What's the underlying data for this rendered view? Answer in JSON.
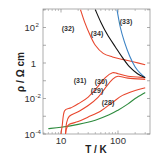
{
  "chart_data": {
    "type": "line",
    "title": "",
    "xlabel": "T / K",
    "ylabel": "ρ / Ω cm",
    "xscale": "log",
    "yscale": "log",
    "xlim": [
      4.8,
      365
    ],
    "ylim": [
      0.0001,
      1000
    ],
    "grid": false,
    "legend": "inline labels",
    "x_ticks": [
      {
        "value": 10,
        "label": "10"
      },
      {
        "value": 100,
        "label": "100"
      }
    ],
    "y_ticks": [
      {
        "value": 0.0001,
        "base": "10",
        "exp": "-4"
      },
      {
        "value": 0.01,
        "base": "10",
        "exp": "-2"
      },
      {
        "value": 1,
        "base": "1",
        "exp": ""
      },
      {
        "value": 100,
        "base": "10",
        "exp": "2"
      }
    ],
    "series": [
      {
        "name": "(28)",
        "color": "#2e8b3e",
        "label_at": [
          108,
          105
        ],
        "points": [
          [
            6,
            0.0002
          ],
          [
            10,
            0.00024
          ],
          [
            20,
            0.00035
          ],
          [
            40,
            0.0006
          ],
          [
            70,
            0.0012
          ],
          [
            100,
            0.0022
          ],
          [
            150,
            0.005
          ],
          [
            200,
            0.01
          ],
          [
            300,
            0.022
          ]
        ]
      },
      {
        "name": "(29)",
        "color": "#e8472e",
        "label_at": [
          97,
          93
        ],
        "points": [
          [
            12,
            0.0001
          ],
          [
            12.5,
            0.0002
          ],
          [
            14,
            0.00035
          ],
          [
            20,
            0.0005
          ],
          [
            30,
            0.0009
          ],
          [
            50,
            0.002
          ],
          [
            80,
            0.006
          ],
          [
            120,
            0.015
          ],
          [
            200,
            0.028
          ],
          [
            300,
            0.04
          ]
        ]
      },
      {
        "name": "(30)",
        "color": "#e8472e",
        "label_at": [
          101,
          84
        ],
        "points": [
          [
            12,
            0.0001
          ],
          [
            12.5,
            0.0004
          ],
          [
            14,
            0.001
          ],
          [
            20,
            0.0018
          ],
          [
            30,
            0.004
          ],
          [
            45,
            0.012
          ],
          [
            60,
            0.04
          ],
          [
            80,
            0.12
          ],
          [
            100,
            0.18
          ],
          [
            150,
            0.14
          ],
          [
            300,
            0.12
          ]
        ]
      },
      {
        "name": "(31)",
        "color": "#e8472e",
        "label_at": [
          80,
          83
        ],
        "points": [
          [
            10,
            0.0001
          ],
          [
            10.5,
            0.0003
          ],
          [
            11.5,
            0.002
          ],
          [
            15,
            0.003
          ],
          [
            20,
            0.005
          ],
          [
            30,
            0.012
          ],
          [
            45,
            0.05
          ],
          [
            60,
            0.15
          ],
          [
            80,
            0.28
          ],
          [
            100,
            0.25
          ],
          [
            150,
            0.18
          ],
          [
            300,
            0.15
          ]
        ]
      },
      {
        "name": "(32)",
        "color": "#e8472e",
        "label_at": [
          68,
          31
        ],
        "points": [
          [
            22,
            1000
          ],
          [
            26,
            200
          ],
          [
            32,
            40
          ],
          [
            40,
            10
          ],
          [
            55,
            3.5
          ],
          [
            80,
            2.2
          ],
          [
            120,
            1.6
          ],
          [
            200,
            1.1
          ],
          [
            300,
            0.8
          ]
        ]
      },
      {
        "name": "(33)",
        "color": "#3b82c4",
        "label_at": [
          126,
          24
        ],
        "points": [
          [
            96,
            1000
          ],
          [
            110,
            100
          ],
          [
            130,
            15
          ],
          [
            160,
            2.5
          ],
          [
            200,
            0.6
          ],
          [
            250,
            0.25
          ],
          [
            300,
            0.15
          ]
        ]
      },
      {
        "name": "(34)",
        "color": "#111111",
        "label_at": [
          97,
          36
        ],
        "points": [
          [
            40,
            1000
          ],
          [
            50,
            200
          ],
          [
            65,
            40
          ],
          [
            90,
            8
          ],
          [
            120,
            2
          ],
          [
            160,
            0.6
          ],
          [
            220,
            0.25
          ],
          [
            300,
            0.15
          ]
        ]
      }
    ]
  }
}
